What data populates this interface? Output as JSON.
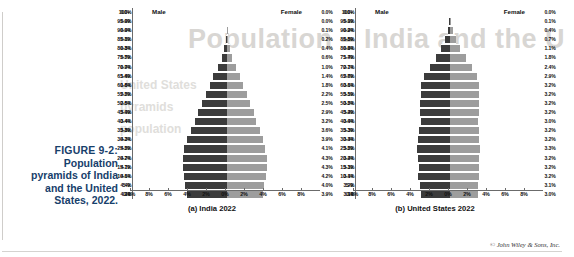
{
  "figure": {
    "label": "FIGURE 9-2:",
    "line1": "Population",
    "line2": "pyramids of India",
    "line3": "and the United",
    "line4": "States, 2022."
  },
  "credit": "© John Wiley & Sons, Inc.",
  "ghost_text": {
    "title": "Population – India and the U",
    "l1": "United States",
    "l2": "pyramids",
    "l3": "population"
  },
  "colors": {
    "male_bar": "#3c3c3c",
    "female_bar": "#9d9d9d",
    "caption": "#17406b",
    "axis": "#6b6b6b"
  },
  "panels": [
    {
      "key": "india",
      "title": "(a) India 2022",
      "male_label": "Male",
      "female_label": "Female"
    },
    {
      "key": "us",
      "title": "(b) United States 2022",
      "male_label": "Male",
      "female_label": "Female"
    }
  ],
  "chart_data": [
    {
      "type": "bar",
      "subtype": "population-pyramid",
      "title": "(a) India 2022",
      "xlabel": "",
      "ylabel": "",
      "xlim": [
        -10,
        10
      ],
      "xticks": [
        "10%",
        "8%",
        "6%",
        "4%",
        "2%",
        "0%",
        "2%",
        "4%",
        "6%",
        "8%"
      ],
      "xtick_values": [
        -10,
        -8,
        -6,
        -4,
        -2,
        0,
        2,
        4,
        6,
        8
      ],
      "grid": false,
      "legend_position": "top",
      "categories": [
        "100+",
        "95-99",
        "90-94",
        "85-89",
        "80-84",
        "75-79",
        "70-74",
        "65-69",
        "60-64",
        "55-59",
        "50-54",
        "45-49",
        "40-44",
        "35-39",
        "30-34",
        "25-29",
        "20-24",
        "15-19",
        "10-14",
        "5-9",
        "0-4"
      ],
      "series": [
        {
          "name": "Male",
          "values": [
            0.0,
            0.0,
            0.0,
            0.1,
            0.3,
            0.5,
            0.9,
            1.4,
            1.8,
            2.2,
            2.6,
            3.0,
            3.4,
            3.8,
            4.2,
            4.5,
            4.7,
            4.7,
            4.6,
            4.4,
            4.2
          ],
          "labels": [
            "0.0%",
            "0.0%",
            "0.0%",
            "0.1%",
            "0.3%",
            "0.5%",
            "0.9%",
            "1.4%",
            "1.8%",
            "2.2%",
            "2.6%",
            "3.0%",
            "3.4%",
            "3.8%",
            "4.2%",
            "4.5%",
            "4.7%",
            "4.7%",
            "4.6%",
            "4.4%",
            "4.2%"
          ]
        },
        {
          "name": "Female",
          "values": [
            0.0,
            0.0,
            0.1,
            0.2,
            0.4,
            0.6,
            1.0,
            1.4,
            1.8,
            2.2,
            2.5,
            2.9,
            3.2,
            3.6,
            3.9,
            4.1,
            4.3,
            4.3,
            4.2,
            4.0,
            3.9
          ],
          "labels": [
            "0.0%",
            "0.0%",
            "0.1%",
            "0.2%",
            "0.4%",
            "0.6%",
            "1.0%",
            "1.4%",
            "1.8%",
            "2.2%",
            "2.5%",
            "2.9%",
            "3.2%",
            "3.6%",
            "3.9%",
            "4.1%",
            "4.3%",
            "4.3%",
            "4.2%",
            "4.0%",
            "3.9%"
          ]
        }
      ]
    },
    {
      "type": "bar",
      "subtype": "population-pyramid",
      "title": "(b) United States 2022",
      "xlabel": "",
      "ylabel": "",
      "xlim": [
        -10,
        10
      ],
      "xticks": [
        "10%",
        "8%",
        "6%",
        "4%",
        "2%",
        "0%",
        "2%",
        "4%",
        "6%",
        "8%"
      ],
      "xtick_values": [
        -10,
        -8,
        -6,
        -4,
        -2,
        0,
        2,
        4,
        6,
        8
      ],
      "grid": false,
      "legend_position": "top",
      "categories": [
        "100+",
        "95-99",
        "90-94",
        "85-89",
        "80-84",
        "75-79",
        "70-74",
        "65-69",
        "60-64",
        "55-59",
        "50-54",
        "45-49",
        "40-44",
        "35-39",
        "30-34",
        "25-29",
        "20-24",
        "15-19",
        "10-14",
        "5-9",
        "0-4"
      ],
      "series": [
        {
          "name": "Male",
          "values": [
            0.0,
            0.1,
            0.2,
            0.5,
            0.9,
            1.4,
            2.1,
            2.7,
            3.1,
            3.1,
            3.2,
            3.2,
            3.0,
            3.3,
            3.4,
            3.5,
            3.4,
            3.3,
            3.4,
            3.2,
            3.1
          ],
          "labels": [
            "0.0%",
            "0.1%",
            "0.2%",
            "0.5%",
            "0.9%",
            "1.4%",
            "2.1%",
            "2.7%",
            "3.1%",
            "3.1%",
            "3.2%",
            "3.2%",
            "3.0%",
            "3.3%",
            "3.4%",
            "3.5%",
            "3.4%",
            "3.3%",
            "3.4%",
            "3.2%",
            "3.1%"
          ]
        },
        {
          "name": "Female",
          "values": [
            0.0,
            0.1,
            0.4,
            0.7,
            1.1,
            1.8,
            2.4,
            2.9,
            3.2,
            3.2,
            3.2,
            3.2,
            3.0,
            3.2,
            3.2,
            3.3,
            3.2,
            3.2,
            3.2,
            3.1,
            3.0
          ],
          "labels": [
            "0.0%",
            "0.1%",
            "0.4%",
            "0.7%",
            "1.1%",
            "1.8%",
            "2.4%",
            "2.9%",
            "3.2%",
            "3.2%",
            "3.2%",
            "3.2%",
            "3.0%",
            "3.2%",
            "3.2%",
            "3.3%",
            "3.2%",
            "3.2%",
            "3.2%",
            "3.1%",
            "3.0%"
          ]
        }
      ]
    }
  ]
}
